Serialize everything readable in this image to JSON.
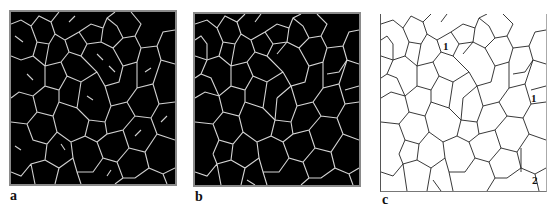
{
  "figure": {
    "panels": [
      {
        "id": "a",
        "label": "a",
        "description": "Binary grain-boundary skeleton, white lines on black, incomplete network"
      },
      {
        "id": "b",
        "label": "b",
        "description": "Binary grain-boundary skeleton, white lines on black, closed network"
      },
      {
        "id": "c",
        "label": "c",
        "description": "Grain-boundary tracing, black lines on white, with annotations",
        "annotations": [
          "1",
          "1",
          "2"
        ]
      }
    ],
    "colors": {
      "boundary_light": "#d0d0d0",
      "background_dark": "#000000",
      "boundary_dark": "#222222",
      "frame": "#8a8a8a"
    }
  }
}
